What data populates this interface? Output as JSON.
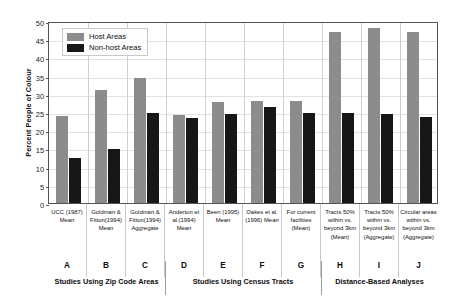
{
  "chart_data": {
    "type": "bar",
    "title": "",
    "xlabel": "",
    "ylabel": "Percent People of Colour",
    "ylim": [
      0,
      50
    ],
    "yticks": [
      0,
      5,
      10,
      15,
      20,
      25,
      30,
      35,
      40,
      45,
      50
    ],
    "grid": true,
    "legend_position": "upper left",
    "categories": [
      "A",
      "B",
      "C",
      "D",
      "E",
      "F",
      "G",
      "H",
      "I",
      "J"
    ],
    "category_labels": [
      "UCC (1987) Mean",
      "Goldman & Fitton(1994) Mean",
      "Goldman & Fitton(1994) Aggregate",
      "Anderton et al.(1994) Mean",
      "Been (1995) Mean",
      "Oakes et al. (1996) Mean",
      "For current facilities (Mean)",
      "Tracts 50% within vs. beyond 3km (Mean)",
      "Tracts 50% within vs. beyond 3km (Aggregate)",
      "Circular areas within vs. beyond 3km (Aggregate)"
    ],
    "series": [
      {
        "name": "Host Areas",
        "color": "#8c8c8c",
        "values": [
          24.0,
          31.0,
          34.3,
          24.2,
          27.7,
          27.9,
          27.9,
          47.0,
          48.0,
          47.0
        ]
      },
      {
        "name": "Non-host Areas",
        "color": "#171717",
        "values": [
          12.5,
          14.8,
          24.8,
          23.3,
          24.4,
          26.4,
          24.7,
          24.8,
          24.4,
          23.7
        ]
      }
    ],
    "group_sections": [
      {
        "label": "Studies Using Zip Code Areas",
        "categories": [
          "A",
          "B",
          "C"
        ]
      },
      {
        "label": "Studies Using Census Tracts",
        "categories": [
          "D",
          "E",
          "F",
          "G"
        ]
      },
      {
        "label": "Distance-Based Analyses",
        "categories": [
          "H",
          "I",
          "J"
        ]
      }
    ]
  },
  "axis": {
    "y_title": "Percent People of Colour",
    "y_ticks": [
      "50",
      "45",
      "40",
      "35",
      "30",
      "25",
      "20",
      "15",
      "10",
      "5",
      "0"
    ]
  },
  "legend": {
    "items": [
      {
        "label": "Host Areas",
        "swatch": "host-swatch"
      },
      {
        "label": "Non-host Areas",
        "swatch": "nonhost-swatch"
      }
    ]
  },
  "x_axis": {
    "cells": [
      {
        "text": "UCC (1987) Mean",
        "letter": "A"
      },
      {
        "text": "Goldman & Fitton(1994) Mean",
        "letter": "B"
      },
      {
        "text": "Goldman & Fitton(1994) Aggregate",
        "letter": "C"
      },
      {
        "text": "Anderton et al.(1994) Mean",
        "letter": "D"
      },
      {
        "text": "Been (1995) Mean",
        "letter": "E"
      },
      {
        "text": "Oakes et al. (1996) Mean",
        "letter": "F"
      },
      {
        "text": "For current facilities (Mean)",
        "letter": "G"
      },
      {
        "text": "Tracts 50% within vs. beyond 3km (Mean)",
        "letter": "H"
      },
      {
        "text": "Tracts 50% within vs. beyond 3km (Aggregate)",
        "letter": "I"
      },
      {
        "text": "Circular areas within vs. beyond 3km (Aggregate)",
        "letter": "J"
      }
    ],
    "groups": [
      "Studies Using Zip Code Areas",
      "Studies Using Census Tracts",
      "Distance-Based Analyses"
    ]
  }
}
